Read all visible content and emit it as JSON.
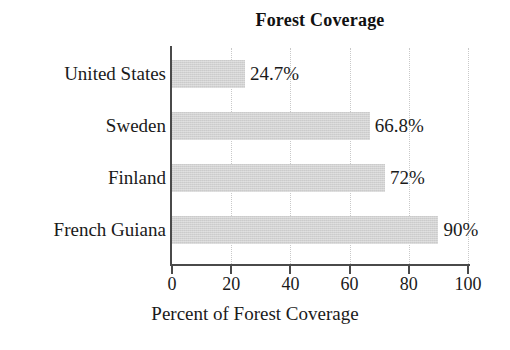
{
  "chart_data": {
    "type": "bar",
    "orientation": "horizontal",
    "title": "Forest Coverage",
    "xlabel": "Percent of Forest Coverage",
    "ylabel": "",
    "categories": [
      "United States",
      "Sweden",
      "Finland",
      "French Guiana"
    ],
    "values": [
      24.7,
      66.8,
      72,
      90
    ],
    "value_labels": [
      "24.7%",
      "66.8%",
      "72%",
      "90%"
    ],
    "xlim": [
      0,
      100
    ],
    "xticks": [
      0,
      20,
      40,
      60,
      80,
      100
    ],
    "xtick_labels": [
      "0",
      "20",
      "40",
      "60",
      "80",
      "100"
    ],
    "gridlines": [
      20,
      40,
      60,
      80,
      100
    ],
    "grid": true,
    "grid_style": "dotted",
    "legend": null,
    "bar_color": "#d2d2d2",
    "axis_color": "#4a4a4a",
    "grid_color": "#c9c9c9",
    "background_color": "#ffffff",
    "text_color": "#1a1a1a"
  }
}
